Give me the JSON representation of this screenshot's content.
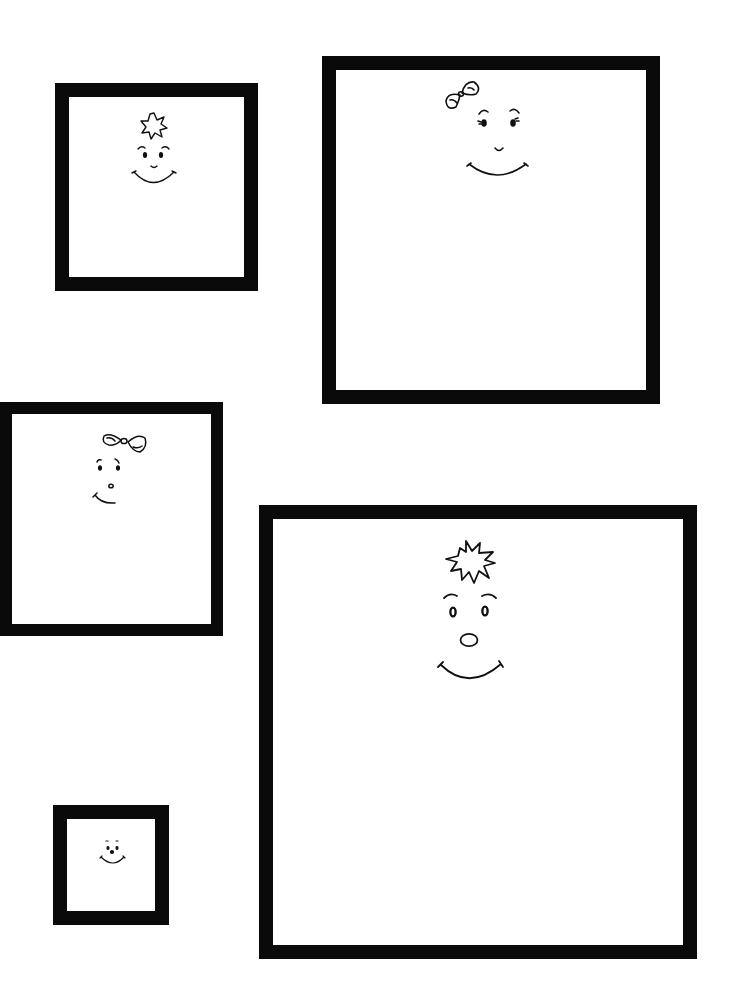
{
  "page": {
    "background": "#ffffff",
    "frame_color": "#0a0a0a",
    "ink_color": "#111111"
  },
  "frames": [
    {
      "id": "frame-1",
      "x": 55,
      "y": 83,
      "width": 203,
      "height": 208,
      "border": 14,
      "face": "smiley",
      "accessory": "spiky-hair-tuft"
    },
    {
      "id": "frame-2",
      "x": 322,
      "y": 56,
      "width": 338,
      "height": 348,
      "border": 14,
      "face": "smiley-with-eyelashes",
      "accessory": "bow"
    },
    {
      "id": "frame-3",
      "x": 0,
      "y": 402,
      "width": 223,
      "height": 234,
      "border": 12,
      "face": "smiley-side",
      "accessory": "bow"
    },
    {
      "id": "frame-4",
      "x": 259,
      "y": 505,
      "width": 438,
      "height": 454,
      "border": 14,
      "face": "smiley-round-nose",
      "accessory": "spiky-hair-tuft"
    },
    {
      "id": "frame-5",
      "x": 53,
      "y": 805,
      "width": 116,
      "height": 120,
      "border": 14,
      "face": "tiny-smiley",
      "accessory": "none"
    }
  ]
}
